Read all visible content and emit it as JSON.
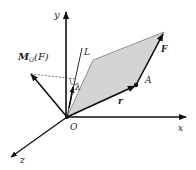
{
  "diagram": {
    "axes": {
      "x_label": "x",
      "y_label": "y",
      "z_label": "z"
    },
    "points": {
      "origin_label": "O",
      "point_label": "A"
    },
    "vectors": {
      "force_label": "F",
      "position_label": "r",
      "moment_label_main": "M",
      "moment_label_sub": "O",
      "moment_label_arg": "(F)",
      "unit_vector_label": "λ"
    },
    "lines": {
      "axis_label": "L"
    },
    "colors": {
      "stroke": "#111111",
      "fill_parallelogram": "#d4d4d4",
      "dashed": "#444444"
    }
  }
}
